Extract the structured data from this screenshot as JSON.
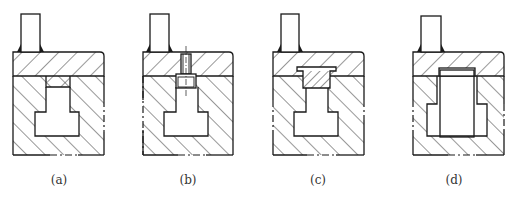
{
  "figure": {
    "panels": [
      {
        "id": "a",
        "label": "(a)",
        "label_x": 59,
        "offset_x": 0,
        "insert": "none"
      },
      {
        "id": "b",
        "label": "(b)",
        "label_x": 188,
        "offset_x": 130,
        "insert": "screw"
      },
      {
        "id": "c",
        "label": "(c)",
        "label_x": 318,
        "offset_x": 260,
        "insert": "key"
      },
      {
        "id": "d",
        "label": "(d)",
        "label_x": 454,
        "offset_x": 400,
        "insert": "block"
      }
    ],
    "colors": {
      "line": "#1a1a1a",
      "background": "#ffffff",
      "label": "#333333"
    }
  }
}
